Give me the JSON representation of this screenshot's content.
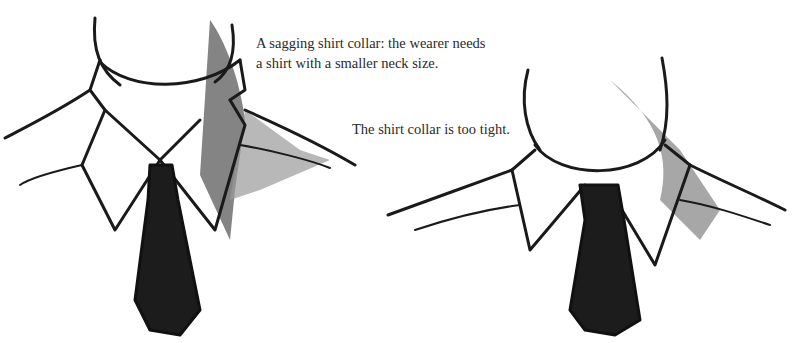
{
  "captions": {
    "sagging_line1": "A sagging shirt collar: the wearer needs",
    "sagging_line2": "a shirt with a smaller neck size.",
    "tight": "The shirt collar is too tight."
  },
  "illustrations": [
    {
      "name": "sagging-collar-illustration",
      "description": "Loose shirt collar with dark tie"
    },
    {
      "name": "tight-collar-illustration",
      "description": "Tight shirt collar with dark tie"
    }
  ],
  "colors": {
    "ink": "#1a1a1a",
    "shade": "#7a7a7a",
    "tie": "#1c1c1c"
  }
}
